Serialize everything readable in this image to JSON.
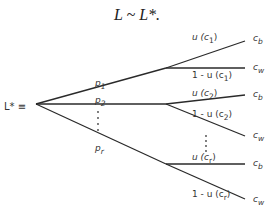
{
  "title": "L ~ L*.",
  "root_label": "L* ≡",
  "branches": [
    {
      "prob": "p1",
      "sub": [
        {
          "label": "u (c1)",
          "outcome": "cb"
        },
        {
          "label": "1 - u (c1)",
          "outcome": "cw"
        }
      ]
    },
    {
      "prob": "p2",
      "sub": [
        {
          "label": "u (c2)",
          "outcome": "cb"
        },
        {
          "label": "1 - u (c2)",
          "outcome": "cw"
        }
      ]
    },
    {
      "prob": "pr",
      "sub": [
        {
          "label": "u (cr)",
          "outcome": "cb"
        },
        {
          "label": "1 - u (cr)",
          "outcome": "cw"
        }
      ]
    }
  ],
  "labels": {
    "p1": "p",
    "p1_sub": "1",
    "p2": "p",
    "p2_sub": "2",
    "pr": "p",
    "pr_sub": "r",
    "u_c1_pre": "u (c",
    "u_c1_sub": "1",
    "u_c1_post": ")",
    "nu_c1_pre": "1 - u (c",
    "nu_c1_sub": "1",
    "nu_c1_post": ")",
    "u_c2_pre": "u (c",
    "u_c2_sub": "2",
    "u_c2_post": ")",
    "nu_c2_pre": "1 - u (c",
    "nu_c2_sub": "2",
    "nu_c2_post": ")",
    "u_cr_pre": "u (c",
    "u_cr_sub": "r",
    "u_cr_post": ")",
    "nu_cr_pre": "1 - u (c",
    "nu_cr_sub": "r",
    "nu_cr_post": ")",
    "c": "c",
    "b": "b",
    "w": "w"
  }
}
